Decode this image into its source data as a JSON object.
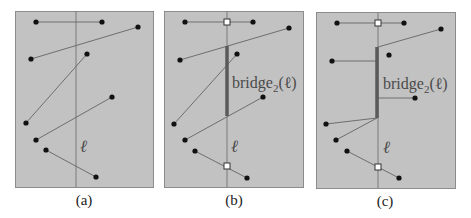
{
  "figure": {
    "panels": [
      {
        "id": "a",
        "caption": "(a)",
        "frame": {
          "x": 15,
          "y": 11,
          "w": 138,
          "h": 176
        },
        "sweep_x": 76,
        "ell_label": "ℓ",
        "ell_pos": {
          "x": 80,
          "y": 152
        },
        "caption_pos": {
          "x": 84,
          "y": 205
        },
        "segments": [
          [
            [
              36,
              22
            ],
            [
              102,
              22
            ]
          ],
          [
            [
              31,
              59
            ],
            [
              138,
              27
            ]
          ],
          [
            [
              26,
              123
            ],
            [
              87,
              54
            ]
          ],
          [
            [
              36,
              140
            ],
            [
              112,
              97
            ]
          ],
          [
            [
              46,
              150
            ],
            [
              96,
              177
            ]
          ]
        ],
        "points": [
          [
            36,
            22
          ],
          [
            102,
            22
          ],
          [
            31,
            59
          ],
          [
            138,
            27
          ],
          [
            87,
            54
          ],
          [
            26,
            123
          ],
          [
            36,
            140
          ],
          [
            112,
            97
          ],
          [
            46,
            150
          ],
          [
            96,
            177
          ]
        ],
        "squares": [],
        "bridge": null,
        "bridge_label": null
      },
      {
        "id": "b",
        "caption": "(b)",
        "frame": {
          "x": 164,
          "y": 11,
          "w": 139,
          "h": 176
        },
        "sweep_x": 227,
        "ell_label": "ℓ",
        "ell_pos": {
          "x": 231,
          "y": 152
        },
        "caption_pos": {
          "x": 234,
          "y": 205
        },
        "segments": [
          [
            [
              185,
              22
            ],
            [
              253,
              22
            ]
          ],
          [
            [
              180,
              60
            ],
            [
              289,
              28
            ]
          ],
          [
            [
              174,
              124
            ],
            [
              237,
              54
            ]
          ],
          [
            [
              185,
              140
            ],
            [
              263,
              97
            ]
          ],
          [
            [
              195,
              151
            ],
            [
              247,
              178
            ]
          ]
        ],
        "points": [
          [
            185,
            22
          ],
          [
            253,
            22
          ],
          [
            180,
            60
          ],
          [
            289,
            28
          ],
          [
            237,
            54
          ],
          [
            174,
            124
          ],
          [
            185,
            140
          ],
          [
            263,
            97
          ],
          [
            195,
            151
          ],
          [
            247,
            178
          ]
        ],
        "squares": [
          [
            227,
            22
          ],
          [
            227,
            166
          ]
        ],
        "bridge": {
          "x": 227,
          "y1": 46,
          "y2": 116
        },
        "bridge_label": {
          "text": "bridge",
          "sub": "2",
          "arg": "(ℓ)",
          "x": 232,
          "y": 88
        }
      },
      {
        "id": "c",
        "caption": "(c)",
        "frame": {
          "x": 316,
          "y": 12,
          "w": 139,
          "h": 176
        },
        "sweep_x": 378,
        "ell_label": "ℓ",
        "ell_pos": {
          "x": 383,
          "y": 153
        },
        "caption_pos": {
          "x": 385,
          "y": 206
        },
        "segments": [
          [
            [
              337,
              23
            ],
            [
              404,
              23
            ]
          ],
          [
            [
              378,
              47
            ],
            [
              441,
              29
            ]
          ],
          [
            [
              332,
              61
            ],
            [
              376,
              61
            ]
          ],
          [
            [
              378,
              98
            ],
            [
              415,
              98
            ]
          ],
          [
            [
              326,
              124
            ],
            [
              377,
              118
            ]
          ],
          [
            [
              336,
              140
            ],
            [
              377,
              118
            ]
          ],
          [
            [
              347,
              151
            ],
            [
              399,
              178
            ]
          ]
        ],
        "points": [
          [
            337,
            23
          ],
          [
            404,
            23
          ],
          [
            441,
            29
          ],
          [
            332,
            61
          ],
          [
            389,
            55
          ],
          [
            415,
            98
          ],
          [
            326,
            124
          ],
          [
            336,
            140
          ],
          [
            347,
            151
          ],
          [
            399,
            178
          ]
        ],
        "squares": [
          [
            378,
            23
          ],
          [
            378,
            167
          ]
        ],
        "bridge": {
          "x": 377,
          "y1": 47,
          "y2": 118
        },
        "bridge_label": {
          "text": "bridge",
          "sub": "2",
          "arg": "(ℓ)",
          "x": 383,
          "y": 89
        }
      }
    ]
  }
}
